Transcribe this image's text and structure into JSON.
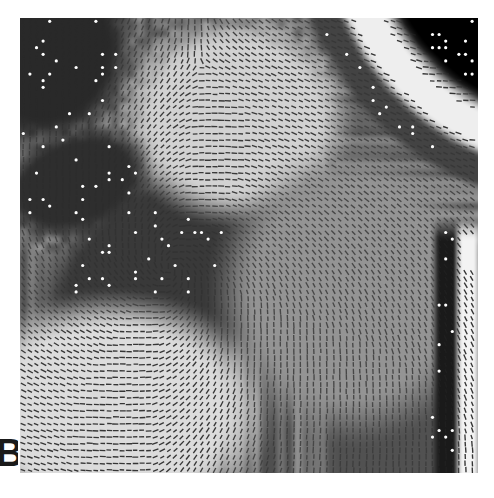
{
  "figure": {
    "panel_label": "B",
    "panel_label_clipped": true,
    "caption_visible": false,
    "modality": "grayscale-mri-slice",
    "overlay": "principal-direction-vector-field"
  },
  "canvas": {
    "width": 494,
    "height": 498,
    "background": "#ffffff"
  },
  "panel": {
    "x": 20,
    "y": 18,
    "width": 458,
    "height": 455,
    "border": "none"
  },
  "colors": {
    "page_background": "#ffffff",
    "image_black": "#000000",
    "image_white": "#ffffff",
    "tissue_mid_gray": "#9a9a9a",
    "tissue_light_gray": "#cfcfcf",
    "tissue_dark_gray": "#3c3c3c",
    "skull_bright": "#f2f2f2",
    "vector_stroke": "#2b2b2b",
    "marker_bright": "#ffffff",
    "label_color": "#1a1a1a"
  },
  "chart_data": {
    "type": "heatmap",
    "title": "",
    "xlabel": "",
    "ylabel": "",
    "grid": false,
    "legend": "none",
    "field": {
      "glyph": "line-segment",
      "grid_spacing_px": 6.6,
      "segment_length_px": 5.4,
      "segment_width_px": 1.35,
      "segment_color": "#2b2b2b",
      "bright_marker_color": "#ffffff",
      "bright_marker_radius_px": 1.6
    },
    "background_field": {
      "note": "Intensity surface built from named anatomical regions listed below.",
      "regions": [
        {
          "name": "background-air-top-right",
          "kind": "wedge",
          "intensity": 0.02,
          "cx": 1.22,
          "cy": -0.22,
          "r_inner": 0.0,
          "r_outer": 0.46
        },
        {
          "name": "skull-scalp-bright-band",
          "kind": "arc",
          "intensity": 0.97,
          "cx": 1.22,
          "cy": -0.22,
          "r_inner": 0.46,
          "r_outer": 0.56
        },
        {
          "name": "skull-inner-dark-rim",
          "kind": "arc",
          "intensity": 0.3,
          "cx": 1.22,
          "cy": -0.22,
          "r_inner": 0.56,
          "r_outer": 0.63
        },
        {
          "name": "ventricle-dark-blob",
          "kind": "blob",
          "intensity": 0.02,
          "cx": 0.33,
          "cy": 0.55,
          "rx": 0.255,
          "ry": 0.145,
          "rot_deg": -32
        },
        {
          "name": "periventricular-dark-halo",
          "kind": "blob",
          "intensity": 0.26,
          "cx": 0.35,
          "cy": 0.55,
          "rx": 0.315,
          "ry": 0.205,
          "rot_deg": -32
        },
        {
          "name": "dark-corner-top-left",
          "kind": "blob",
          "intensity": 0.2,
          "cx": 0.055,
          "cy": 0.07,
          "rx": 0.17,
          "ry": 0.19,
          "rot_deg": 12
        },
        {
          "name": "bright-white-matter-lower-left",
          "kind": "blob",
          "intensity": 0.9,
          "cx": 0.2,
          "cy": 0.86,
          "rx": 0.3,
          "ry": 0.22,
          "rot_deg": 0
        },
        {
          "name": "bright-white-matter-upper-center",
          "kind": "blob",
          "intensity": 0.86,
          "cx": 0.47,
          "cy": 0.22,
          "rx": 0.22,
          "ry": 0.2,
          "rot_deg": 0
        },
        {
          "name": "gray-matter-mid-right",
          "kind": "blob",
          "intensity": 0.62,
          "cx": 0.72,
          "cy": 0.6,
          "rx": 0.26,
          "ry": 0.28,
          "rot_deg": 0
        },
        {
          "name": "dark-vertical-stripe-right",
          "kind": "vstripe",
          "intensity": 0.14,
          "x0": 0.905,
          "x1": 0.955,
          "y0": 0.46,
          "y1": 1.02
        },
        {
          "name": "bright-vertical-stripe-far-right",
          "kind": "vstripe",
          "intensity": 0.99,
          "x0": 0.955,
          "x1": 1.0,
          "y0": 0.46,
          "y1": 1.02
        },
        {
          "name": "dark-band-above-ventricle-left",
          "kind": "blob",
          "intensity": 0.22,
          "cx": 0.12,
          "cy": 0.36,
          "rx": 0.15,
          "ry": 0.1,
          "rot_deg": -20
        }
      ]
    },
    "orientation_sources": [
      {
        "name": "ventricle-radial-source",
        "cx": 0.33,
        "cy": 0.55,
        "weight": 1.3,
        "mode": "tangential"
      },
      {
        "name": "cortex-arc-source",
        "cx": 1.22,
        "cy": -0.22,
        "weight": 1.1,
        "mode": "tangential"
      },
      {
        "name": "lower-left-vertical-source",
        "cx": 0.22,
        "cy": 1.45,
        "weight": 0.85,
        "mode": "radial"
      },
      {
        "name": "upper-center-source",
        "cx": 0.5,
        "cy": -0.25,
        "weight": 0.7,
        "mode": "radial"
      },
      {
        "name": "right-edge-vertical-source",
        "cx": 1.55,
        "cy": 0.7,
        "weight": 0.8,
        "mode": "tangential"
      }
    ]
  }
}
